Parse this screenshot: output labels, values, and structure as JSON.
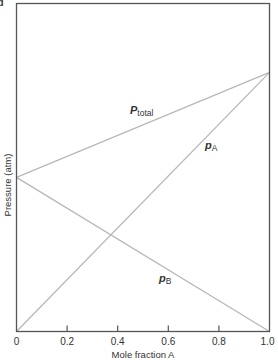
{
  "panel_letter": "d",
  "chart_data": {
    "type": "line",
    "title": "",
    "xlabel": "Mole fraction A",
    "ylabel": "Pressure (atm)",
    "xlim": [
      0,
      1.0
    ],
    "ylim": [
      0,
      1.0
    ],
    "x_ticks": [
      0,
      0.2,
      0.4,
      0.6,
      0.8,
      1.0
    ],
    "x_tick_labels": [
      "0",
      "0.2",
      "0.4",
      "0.6",
      "0.8",
      "1.0"
    ],
    "y_ticks": [],
    "grid": false,
    "legend": "inline labels",
    "x": [
      0,
      1.0
    ],
    "series": [
      {
        "name": "P_total",
        "label_main": "P",
        "label_sub": "total",
        "values": [
          0.47,
          0.79
        ]
      },
      {
        "name": "p_A",
        "label_main": "p",
        "label_sub": "A",
        "values": [
          0,
          0.79
        ]
      },
      {
        "name": "p_B",
        "label_main": "p",
        "label_sub": "B",
        "values": [
          0.47,
          0
        ]
      }
    ],
    "line_color": "#b8b8b8",
    "frame_color": "#555555"
  }
}
